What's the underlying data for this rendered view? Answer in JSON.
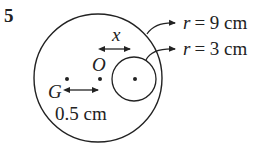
{
  "question": {
    "number": "5"
  },
  "diagram": {
    "labels": {
      "x": "x",
      "O": "O",
      "G": "G",
      "distance": "0.5 cm",
      "r_outer_var": "r",
      "r_outer_val": "= 9 cm",
      "r_inner_var": "r",
      "r_inner_val": "= 3 cm"
    },
    "colors": {
      "stroke": "#222222",
      "background": "#ffffff"
    }
  }
}
